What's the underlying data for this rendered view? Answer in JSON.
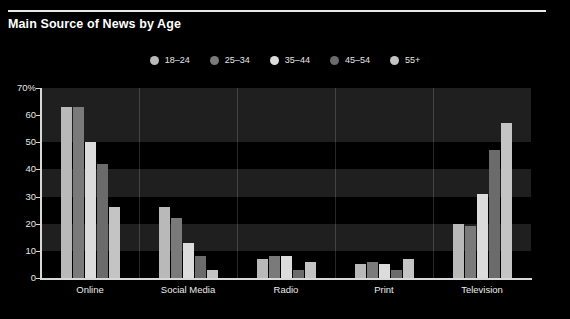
{
  "chart_data": {
    "type": "bar",
    "title": "Main Source of News by Age",
    "xlabel": "",
    "ylabel": "",
    "ylim": [
      0,
      70
    ],
    "yticks": [
      0,
      10,
      20,
      30,
      40,
      50,
      60,
      70
    ],
    "ytick_labels": [
      "0",
      "10",
      "20",
      "30",
      "40",
      "50",
      "60",
      "70%"
    ],
    "grid": true,
    "legend_position": "top-center",
    "categories": [
      "Online",
      "Social Media",
      "Radio",
      "Print",
      "Television"
    ],
    "series": [
      {
        "name": "18–24",
        "color": "#b9b9b9",
        "values": [
          63,
          26,
          7,
          5,
          20
        ]
      },
      {
        "name": "25–34",
        "color": "#7a7a7a",
        "values": [
          63,
          22,
          8,
          6,
          19
        ]
      },
      {
        "name": "35–44",
        "color": "#dcdcdc",
        "values": [
          50,
          13,
          8,
          5,
          31
        ]
      },
      {
        "name": "45–54",
        "color": "#6b6b6b",
        "values": [
          42,
          8,
          3,
          3,
          47
        ]
      },
      {
        "name": "55+",
        "color": "#c4c4c4",
        "values": [
          26,
          3,
          6,
          7,
          57
        ]
      }
    ]
  },
  "style": {
    "background": "#000000",
    "band_color": "#1f1f1f",
    "axis_color": "#d8d8d8",
    "text_color": "#ffffff",
    "rule_color": "#e8e8e8"
  }
}
